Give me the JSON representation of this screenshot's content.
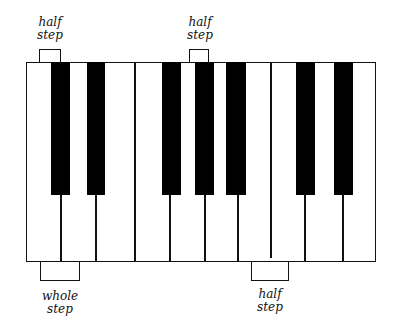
{
  "diagram": {
    "white_key_count": 10,
    "black_key_count": 7,
    "labels": [
      {
        "id": "top-left",
        "line1": "half",
        "line2": "step"
      },
      {
        "id": "top-mid",
        "line1": "half",
        "line2": "step"
      },
      {
        "id": "bottom-left",
        "line1": "whole",
        "line2": "step"
      },
      {
        "id": "bottom-right",
        "line1": "half",
        "line2": "step"
      }
    ]
  }
}
